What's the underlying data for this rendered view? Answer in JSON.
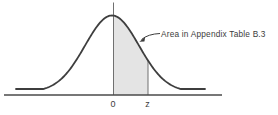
{
  "figure": {
    "annotation_label": "Area in Appendix Table B.3",
    "axis_labels": {
      "zero": "0",
      "z": "z"
    },
    "colors": {
      "curve": "#3e3e3e",
      "axis": "#4a4a4a",
      "guide": "#707070",
      "fill": "#e4e4e4",
      "text": "#3c3c3c",
      "background": "#ffffff"
    }
  }
}
